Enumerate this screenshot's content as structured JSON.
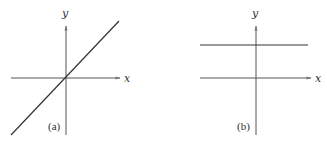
{
  "figure": {
    "panels": [
      {
        "id": "a",
        "label": "(a)",
        "x_axis_label": "x",
        "y_axis_label": "y",
        "description": "Straight line through the origin with positive slope"
      },
      {
        "id": "b",
        "label": "(b)",
        "x_axis_label": "x",
        "y_axis_label": "y",
        "description": "Horizontal line above the x-axis (constant y)"
      }
    ],
    "colors": {
      "axis": "#555555",
      "line": "#333333",
      "text": "#333333",
      "background": "#ffffff"
    }
  }
}
